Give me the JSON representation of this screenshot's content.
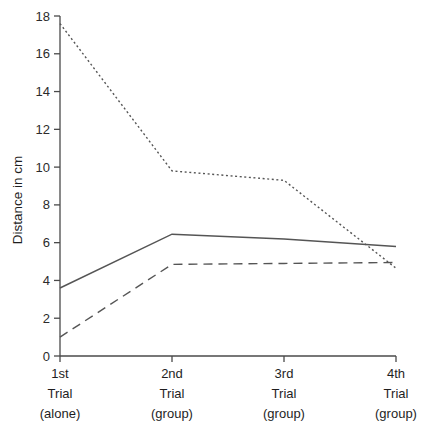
{
  "chart_data": {
    "type": "line",
    "title": "",
    "xlabel": "",
    "ylabel": "Distance in cm",
    "categories": [
      "1st\nTrial\n(alone)",
      "2nd\nTrial\n(group)",
      "3rd\nTrial\n(group)",
      "4th\nTrial\n(group)"
    ],
    "category_lines": [
      [
        "1st",
        "Trial",
        "(alone)"
      ],
      [
        "2nd",
        "Trial",
        "(group)"
      ],
      [
        "3rd",
        "Trial",
        "(group)"
      ],
      [
        "4th",
        "Trial",
        "(group)"
      ]
    ],
    "ylim": [
      0,
      18
    ],
    "ytick_labels": [
      "0",
      "2",
      "4",
      "6",
      "8",
      "10",
      "12",
      "14",
      "16",
      "18"
    ],
    "ytick_values": [
      0,
      2,
      4,
      6,
      8,
      10,
      12,
      14,
      16,
      18
    ],
    "grid": false,
    "legend": "none",
    "series": [
      {
        "name": "dotted-series",
        "style": "dotted",
        "color": "#555555",
        "values": [
          17.6,
          9.8,
          9.3,
          4.65
        ]
      },
      {
        "name": "solid-series",
        "style": "solid",
        "color": "#555555",
        "values": [
          3.6,
          6.45,
          6.2,
          5.8
        ]
      },
      {
        "name": "dashed-series",
        "style": "dashed",
        "color": "#555555",
        "values": [
          1.0,
          4.85,
          4.9,
          4.95
        ]
      }
    ]
  },
  "axis": {
    "y_title": "Distance in cm"
  }
}
